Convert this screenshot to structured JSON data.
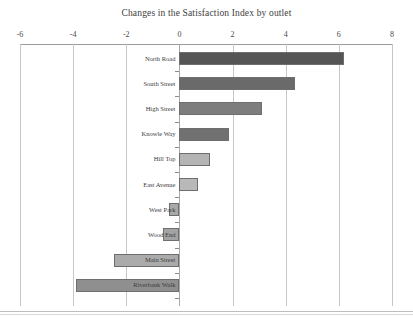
{
  "chart_data": {
    "type": "bar",
    "orientation": "horizontal",
    "title": "Changes in the Satisfaction Index by outlet",
    "xlabel": "",
    "ylabel": "",
    "xlim": [
      -6,
      8
    ],
    "xticks": [
      -6,
      -4,
      -2,
      0,
      2,
      4,
      6,
      8
    ],
    "xtick_labels": [
      "-6",
      "-4",
      "-2",
      "0",
      "2",
      "4",
      "6",
      "8"
    ],
    "grid": true,
    "grid_axis": "x",
    "legend": false,
    "categories": [
      "North Road",
      "South Street",
      "High Street",
      "Knowle Way",
      "Hill Top",
      "East Avenue",
      "West Park",
      "Wood End",
      "Main Street",
      "Riverbank Walk"
    ],
    "values": [
      6.2,
      4.35,
      3.1,
      1.85,
      1.15,
      0.7,
      -0.4,
      -0.6,
      -2.45,
      -3.9
    ],
    "bar_colors": [
      "#555555",
      "#6a6a6a",
      "#7d7d7d",
      "#717171",
      "#b4b4b4",
      "#b9b9b9",
      "#a8a8a8",
      "#a3a3a3",
      "#ababab",
      "#8f8f8f"
    ],
    "bar_border_color": "#6e6e6e",
    "axis_color": "#9a9a9a",
    "gridline_color": "#c6c6c6",
    "background": "#ffffff"
  }
}
